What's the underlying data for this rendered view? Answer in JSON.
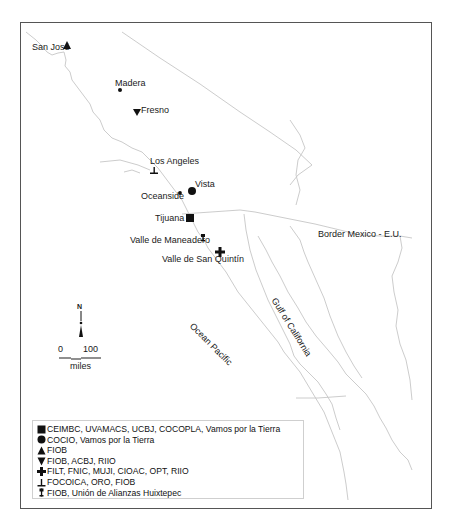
{
  "map": {
    "cities": [
      {
        "name": "San José",
        "symbol": "triangle-up",
        "x": 67,
        "y": 46
      },
      {
        "name": "Madera",
        "symbol": "small-dot",
        "x": 120,
        "y": 90
      },
      {
        "name": "Fresno",
        "symbol": "triangle-down",
        "x": 137,
        "y": 111
      },
      {
        "name": "Los Angeles",
        "symbol": "inverted-t",
        "x": 154,
        "y": 172
      },
      {
        "name": "Vista",
        "symbol": "circle",
        "x": 192,
        "y": 191
      },
      {
        "name": "Oceanside",
        "symbol": "small-dot",
        "x": 180,
        "y": 192
      },
      {
        "name": "Tijuana",
        "symbol": "square",
        "x": 190,
        "y": 218
      },
      {
        "name": "Valle de Maneadero",
        "symbol": "pin",
        "x": 203,
        "y": 238
      },
      {
        "name": "Valle de San Quintín",
        "symbol": "cross",
        "x": 220,
        "y": 252
      }
    ],
    "region_labels": {
      "border": "Border Mexico - E.U.",
      "gulf": "Gulf of California",
      "ocean": "Ocean Pacific"
    },
    "north_label": "N",
    "scale": {
      "start": "0",
      "end": "100",
      "unit": "miles"
    }
  },
  "legend": {
    "items": [
      {
        "symbol": "square",
        "label": "CEIMBC, UVAMACS, UCBJ, COCOPLA, Vamos por la Tierra"
      },
      {
        "symbol": "circle",
        "label": "COCIO, Vamos por la Tierra"
      },
      {
        "symbol": "triangle-up",
        "label": "FIOB"
      },
      {
        "symbol": "triangle-down",
        "label": "FIOB, ACBJ, RIIO"
      },
      {
        "symbol": "cross",
        "label": "FILT, FNIC, MUJI, CIOAC, OPT, RIIO"
      },
      {
        "symbol": "inverted-t",
        "label": "FOCOICA, ORO, FIOB"
      },
      {
        "symbol": "pin",
        "label": "FIOB, Unión de Alianzas Huixtepec"
      }
    ]
  },
  "colors": {
    "outline": "#c8c8c8",
    "symbol": "#111111",
    "frame": "#555555"
  }
}
